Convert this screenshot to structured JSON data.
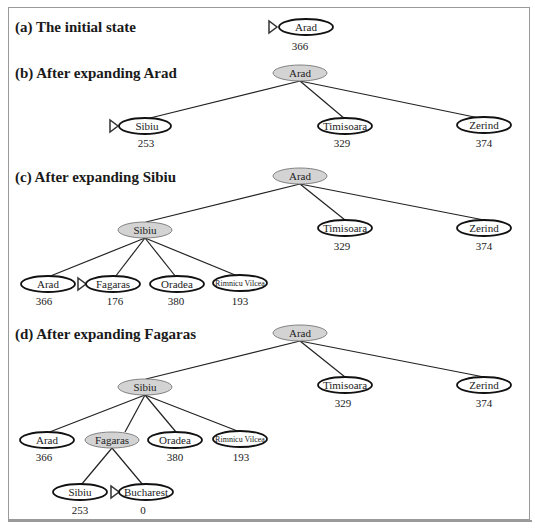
{
  "panels": [
    {
      "id": "a",
      "title": "(a) The initial state",
      "nodes": [
        {
          "id": "arad",
          "label": "Arad",
          "value": "366",
          "expanded": false,
          "next": true
        }
      ]
    },
    {
      "id": "b",
      "title": "(b) After expanding Arad",
      "nodes": [
        {
          "id": "arad",
          "label": "Arad",
          "value": "",
          "expanded": true
        },
        {
          "id": "sibiu",
          "label": "Sibiu",
          "value": "253",
          "expanded": false,
          "next": true
        },
        {
          "id": "timisoara",
          "label": "Timisoara",
          "value": "329",
          "expanded": false
        },
        {
          "id": "zerind",
          "label": "Zerind",
          "value": "374",
          "expanded": false
        }
      ]
    },
    {
      "id": "c",
      "title": "(c) After expanding Sibiu",
      "nodes": [
        {
          "id": "arad",
          "label": "Arad",
          "value": "",
          "expanded": true
        },
        {
          "id": "sibiu",
          "label": "Sibiu",
          "value": "",
          "expanded": true
        },
        {
          "id": "timisoara",
          "label": "Timisoara",
          "value": "329",
          "expanded": false
        },
        {
          "id": "zerind",
          "label": "Zerind",
          "value": "374",
          "expanded": false
        },
        {
          "id": "arad2",
          "label": "Arad",
          "value": "366",
          "expanded": false
        },
        {
          "id": "fagaras",
          "label": "Fagaras",
          "value": "176",
          "expanded": false,
          "next": true
        },
        {
          "id": "oradea",
          "label": "Oradea",
          "value": "380",
          "expanded": false
        },
        {
          "id": "rimnicu",
          "label": "Rimnicu Vilcea",
          "value": "193",
          "expanded": false
        }
      ]
    },
    {
      "id": "d",
      "title": "(d) After expanding Fagaras",
      "nodes": [
        {
          "id": "arad",
          "label": "Arad",
          "value": "",
          "expanded": true
        },
        {
          "id": "sibiu",
          "label": "Sibiu",
          "value": "",
          "expanded": true
        },
        {
          "id": "timisoara",
          "label": "Timisoara",
          "value": "329",
          "expanded": false
        },
        {
          "id": "zerind",
          "label": "Zerind",
          "value": "374",
          "expanded": false
        },
        {
          "id": "arad2",
          "label": "Arad",
          "value": "366",
          "expanded": false
        },
        {
          "id": "fagaras",
          "label": "Fagaras",
          "value": "",
          "expanded": true
        },
        {
          "id": "oradea",
          "label": "Oradea",
          "value": "380",
          "expanded": false
        },
        {
          "id": "rimnicu",
          "label": "Rimnicu Vilcea",
          "value": "193",
          "expanded": false
        },
        {
          "id": "sibiu2",
          "label": "Sibiu",
          "value": "253",
          "expanded": false
        },
        {
          "id": "bucharest",
          "label": "Bucharest",
          "value": "0",
          "expanded": false,
          "next": true
        }
      ]
    }
  ],
  "colors": {
    "expanded_fill": "#d3d3d3",
    "frame": "#9a9a9a",
    "stroke": "#111111"
  }
}
